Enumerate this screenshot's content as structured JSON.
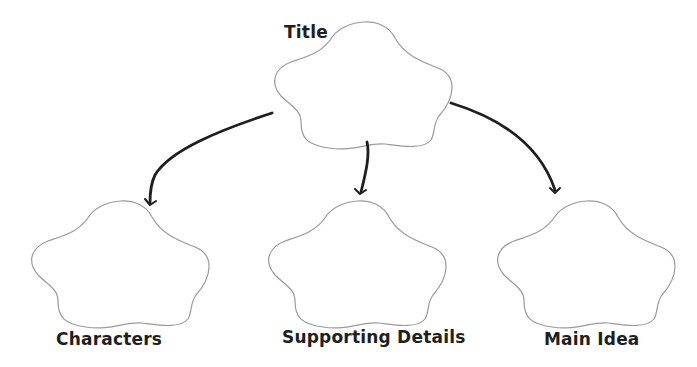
{
  "diagram": {
    "type": "story-map / graphic organizer",
    "nodes": [
      {
        "id": "title",
        "label": "Title",
        "shape": "cloud",
        "position": "top-center"
      },
      {
        "id": "characters",
        "label": "Characters",
        "shape": "cloud",
        "position": "bottom-left"
      },
      {
        "id": "supporting",
        "label": "Supporting Details",
        "shape": "cloud",
        "position": "bottom-center"
      },
      {
        "id": "main_idea",
        "label": "Main Idea",
        "shape": "cloud",
        "position": "bottom-right"
      }
    ],
    "edges": [
      {
        "from": "title",
        "to": "characters"
      },
      {
        "from": "title",
        "to": "supporting"
      },
      {
        "from": "title",
        "to": "main_idea"
      }
    ],
    "colors": {
      "cloud_outline": "#9a9a9a",
      "arrow": "#1e1e1e",
      "text": "#1f1f1f",
      "background": "#ffffff"
    }
  }
}
